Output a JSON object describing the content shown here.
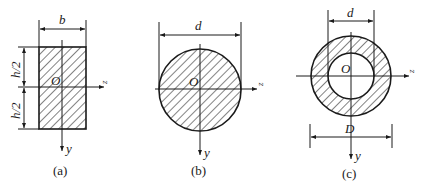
{
  "figure": {
    "panels": [
      {
        "id": "a",
        "caption": "(a)",
        "shape": "rectangle",
        "labels": {
          "width": "b",
          "half_height_top": "h/2",
          "half_height_bottom": "h/2",
          "origin": "O",
          "z_axis": "z",
          "y_axis": "y"
        }
      },
      {
        "id": "b",
        "caption": "(b)",
        "shape": "solid-circle",
        "labels": {
          "diameter": "d",
          "origin": "O",
          "z_axis": "z",
          "y_axis": "y"
        }
      },
      {
        "id": "c",
        "caption": "(c)",
        "shape": "hollow-circle",
        "labels": {
          "inner_diameter": "d",
          "outer_diameter": "D",
          "origin": "O",
          "z_axis": "z",
          "y_axis": "y"
        }
      }
    ],
    "colors": {
      "line": "#1a1a1a",
      "background": "#ffffff"
    }
  }
}
